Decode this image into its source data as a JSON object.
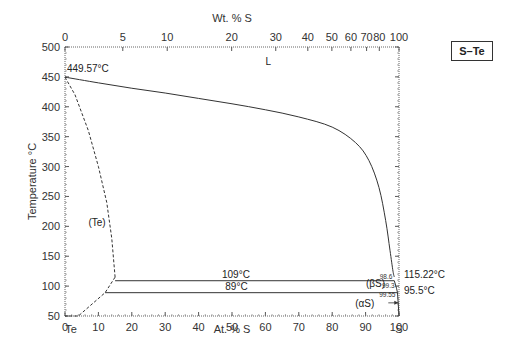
{
  "chart_data": {
    "type": "line",
    "title": "S–Te",
    "system_label": "S–Te",
    "xlabel": "At. % S",
    "xlabel_top": "Wt. % S",
    "ylabel": "Temperature °C",
    "xlim": [
      0,
      100
    ],
    "ylim": [
      50,
      500
    ],
    "x_ticks_bottom": [
      0,
      10,
      20,
      30,
      40,
      50,
      60,
      70,
      80,
      90,
      100
    ],
    "x_ticks_top": [
      {
        "wt": 0,
        "at": 0
      },
      {
        "wt": 5,
        "at": 17.3
      },
      {
        "wt": 10,
        "at": 30.6
      },
      {
        "wt": 20,
        "at": 49.9
      },
      {
        "wt": 30,
        "at": 63.1
      },
      {
        "wt": 40,
        "at": 72.7
      },
      {
        "wt": 50,
        "at": 79.9
      },
      {
        "wt": 60,
        "at": 85.6
      },
      {
        "wt": 70,
        "at": 90.3
      },
      {
        "wt": 80,
        "at": 94.1
      },
      {
        "wt": 100,
        "at": 100
      }
    ],
    "y_ticks": [
      50,
      100,
      150,
      200,
      250,
      300,
      350,
      400,
      450,
      500
    ],
    "end_labels": {
      "left": "Te",
      "right": "S"
    },
    "grid": false,
    "series": [
      {
        "name": "liquidus",
        "style": "solid",
        "x": [
          0,
          10,
          20,
          30,
          40,
          50,
          60,
          70,
          80,
          87,
          91,
          94,
          96,
          97.3,
          98.2,
          98.6
        ],
        "y": [
          449.57,
          440,
          431,
          423,
          414,
          405,
          395,
          383,
          366,
          340,
          310,
          265,
          210,
          160,
          125,
          115.22
        ]
      },
      {
        "name": "(Te) solvus",
        "style": "dashed",
        "x": [
          0,
          3,
          7,
          10,
          12.5,
          14,
          15
        ],
        "y": [
          449.57,
          420,
          360,
          300,
          240,
          180,
          115
        ]
      },
      {
        "name": "(Te) lower boundary",
        "style": "dashed",
        "x": [
          15,
          12,
          4,
          0
        ],
        "y": [
          115,
          89,
          50,
          50
        ]
      },
      {
        "name": "eutectic 109°C",
        "style": "solid",
        "x": [
          15,
          98.6
        ],
        "y": [
          109,
          109
        ]
      },
      {
        "name": "eutectoid 89°C",
        "style": "solid",
        "x": [
          12,
          99.55
        ],
        "y": [
          89,
          89
        ]
      },
      {
        "name": "S side boundary",
        "style": "solid",
        "x": [
          98.6,
          99.3,
          99.55,
          100
        ],
        "y": [
          109,
          95.5,
          89,
          50
        ]
      }
    ],
    "annotations": [
      {
        "text": "449.57°C",
        "x": 0,
        "y": 449.57
      },
      {
        "text": "L",
        "x": 60,
        "y": 470
      },
      {
        "text": "(Te)",
        "x": 7,
        "y": 200
      },
      {
        "text": "109°C",
        "x": 47,
        "y": 109
      },
      {
        "text": "89°C",
        "x": 48,
        "y": 89
      },
      {
        "text": "98.6",
        "x": 98.6,
        "y": 109
      },
      {
        "text": "99.3",
        "x": 99.3,
        "y": 95.5
      },
      {
        "text": "99.55",
        "x": 99.55,
        "y": 89
      },
      {
        "text": "(βS)",
        "x": 95,
        "y": 99
      },
      {
        "text": "(αS)",
        "x": 95,
        "y": 70
      },
      {
        "text": "115.22°C",
        "x": 100,
        "y": 115.22
      },
      {
        "text": "95.5°C",
        "x": 100,
        "y": 95.5
      }
    ]
  }
}
